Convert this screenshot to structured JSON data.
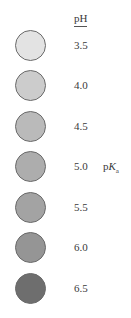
{
  "header": {
    "label": "pH"
  },
  "rows": [
    {
      "ph": "3.5",
      "color": "#e3e3e3"
    },
    {
      "ph": "4.0",
      "color": "#cccccc"
    },
    {
      "ph": "4.5",
      "color": "#bababa"
    },
    {
      "ph": "5.0",
      "color": "#adadad"
    },
    {
      "ph": "5.5",
      "color": "#a3a3a3"
    },
    {
      "ph": "6.0",
      "color": "#959595"
    },
    {
      "ph": "6.5",
      "color": "#6e6e6e"
    }
  ],
  "pka_label": {
    "prefix": "p",
    "italic": "K",
    "subscript": "a",
    "row_index": 3
  }
}
